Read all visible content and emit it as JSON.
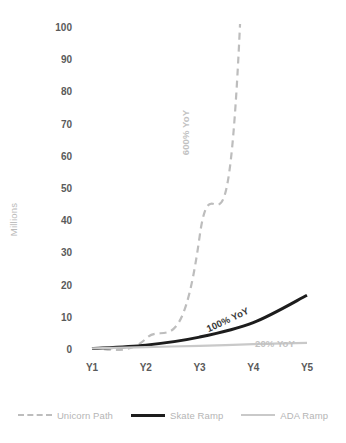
{
  "chart_data": {
    "type": "line",
    "title": "",
    "subtitle": "",
    "xlabel": "",
    "ylabel": "Millions",
    "categories": [
      "Y1",
      "Y2",
      "Y3",
      "Y4",
      "Y5"
    ],
    "x_tick_labels": [
      "Y1",
      "Y2",
      "Y3",
      "Y4",
      "Y5"
    ],
    "y_tick_labels": [
      "100",
      "90",
      "80",
      "70",
      "60",
      "50",
      "40",
      "30",
      "20",
      "10",
      "0"
    ],
    "ylim": [
      0,
      100
    ],
    "y_tick_step": 10,
    "grid": false,
    "legend_position": "bottom",
    "series": [
      {
        "name": "Unicorn Path",
        "style": "dashed",
        "color": "#bdbdbd",
        "values": [
          0.5,
          3.5,
          35,
          245,
          1715
        ],
        "clipped_above_axis": true,
        "annotation": "600% YoY"
      },
      {
        "name": "Skate Ramp",
        "style": "solid",
        "color": "#1d1d1d",
        "values": [
          0.5,
          1.5,
          4,
          8.5,
          17
        ],
        "annotation": "100% YoY"
      },
      {
        "name": "ADA Ramp",
        "style": "solid",
        "color": "#c9c9c9",
        "values": [
          0.5,
          0.9,
          1.3,
          1.8,
          2.2
        ],
        "annotation": "20% YoY"
      }
    ],
    "annotations": [
      {
        "text": "600% YoY",
        "rotation": -90,
        "color": "#c2c2c2"
      },
      {
        "text": "100% YoY",
        "rotation": -25,
        "color": "#3a3a3a"
      },
      {
        "text": "20% YoY",
        "rotation": 0,
        "color": "#c2c2c2"
      }
    ]
  },
  "legend": {
    "items": [
      {
        "label": "Unicorn Path",
        "swatch": "dashed-gray-line-icon"
      },
      {
        "label": "Skate Ramp",
        "swatch": "solid-black-line-icon"
      },
      {
        "label": "ADA Ramp",
        "swatch": "solid-lightgray-line-icon"
      }
    ]
  },
  "colors": {
    "background": "#ffffff",
    "unicorn_path": "#bdbdbd",
    "skate_ramp": "#1d1d1d",
    "ada_ramp": "#c9c9c9",
    "tick_text": "#5a5a5a",
    "axis_title": "#b9b9b9",
    "legend_text": "#b5b5b5"
  }
}
